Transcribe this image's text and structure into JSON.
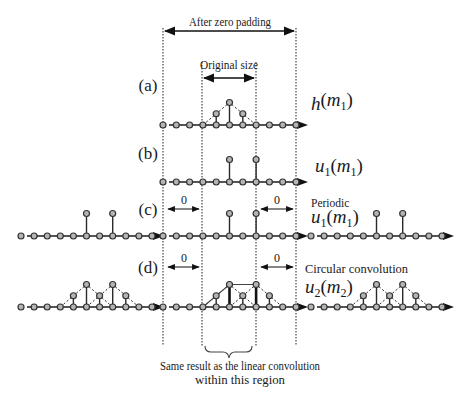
{
  "figure": {
    "top_span_label": "After zero padding",
    "original_span_label": "Original size",
    "zero_label": "0",
    "bottom_note": [
      "Same result as the linear convolution",
      "within this region"
    ],
    "rows": [
      {
        "id": "a",
        "tag": "(a)",
        "caption": "",
        "signal": {
          "fn": "h",
          "fn_sub": "",
          "arg": "m",
          "arg_sub": "1"
        },
        "periodic": false,
        "zero_regions": false,
        "values": [
          0,
          0,
          0,
          0,
          0.5,
          1,
          0.5,
          0,
          0,
          0,
          0
        ],
        "envelope_triangles": [
          [
            3,
            5,
            7
          ]
        ],
        "linear_outline": []
      },
      {
        "id": "b",
        "tag": "(b)",
        "caption": "",
        "signal": {
          "fn": "u",
          "fn_sub": "1",
          "arg": "m",
          "arg_sub": "1"
        },
        "periodic": false,
        "zero_regions": false,
        "values": [
          0,
          0,
          0,
          0,
          0,
          1,
          0,
          1,
          0,
          0,
          0
        ],
        "envelope_triangles": [],
        "linear_outline": []
      },
      {
        "id": "c",
        "tag": "(c)",
        "caption": "Periodic",
        "signal": {
          "fn": "u",
          "fn_sub": "1",
          "arg": "m",
          "arg_sub": "1"
        },
        "periodic": true,
        "zero_regions": true,
        "values": [
          0,
          0,
          0,
          0,
          0,
          1,
          0,
          1,
          0,
          0,
          0
        ],
        "envelope_triangles": [],
        "linear_outline": []
      },
      {
        "id": "d",
        "tag": "(d)",
        "caption": "Circular convolution",
        "signal": {
          "fn": "u",
          "fn_sub": "2",
          "arg": "m",
          "arg_sub": "2"
        },
        "periodic": true,
        "zero_regions": true,
        "values": [
          0,
          0,
          0,
          0,
          0.5,
          1,
          0.5,
          1,
          0.5,
          0,
          0
        ],
        "envelope_triangles": [
          [
            3,
            5,
            7
          ],
          [
            5,
            7,
            9
          ]
        ],
        "linear_outline": [
          3,
          5,
          7
        ]
      }
    ]
  }
}
